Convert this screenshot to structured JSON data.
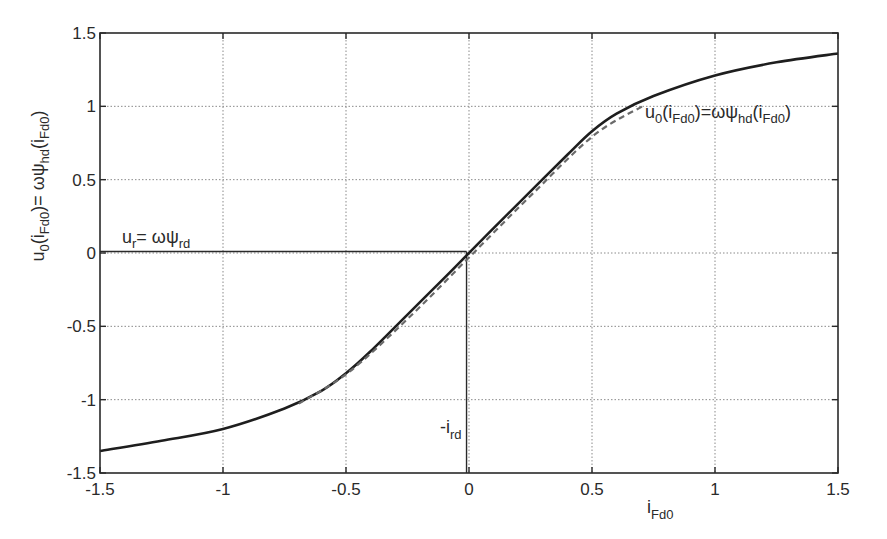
{
  "chart_data": {
    "type": "line",
    "title": "",
    "xlabel": "i_Fd0",
    "ylabel": "u0(iFd0)= ωψhd(iFd0)",
    "xlim": [
      -1.5,
      1.5
    ],
    "ylim": [
      -1.5,
      1.5
    ],
    "grid": true,
    "x_ticks": [
      -1.5,
      -1,
      -0.5,
      0,
      0.5,
      1,
      1.5
    ],
    "x_tick_labels": [
      "-1.5",
      "-1",
      "-0.5",
      "0",
      "0.5",
      "1",
      "1.5"
    ],
    "y_ticks": [
      -1.5,
      -1,
      -0.5,
      0,
      0.5,
      1,
      1.5
    ],
    "y_tick_labels": [
      "-1.5",
      "-1",
      "-0.5",
      "0",
      "0.5",
      "1",
      "1.5"
    ],
    "series": [
      {
        "name": "u0(iFd0)=ωψhd(iFd0)",
        "style": "solid",
        "x": [
          -1.5,
          -1.25,
          -1.0,
          -0.75,
          -0.6,
          -0.5,
          -0.4,
          -0.25,
          -0.1,
          0.0,
          0.1,
          0.25,
          0.4,
          0.5,
          0.6,
          0.75,
          1.0,
          1.25,
          1.5
        ],
        "values": [
          -1.35,
          -1.28,
          -1.2,
          -1.06,
          -0.94,
          -0.82,
          -0.67,
          -0.42,
          -0.17,
          0.0,
          0.17,
          0.42,
          0.67,
          0.83,
          0.95,
          1.07,
          1.21,
          1.3,
          1.36
        ]
      },
      {
        "name": "linearized approximation",
        "style": "dashed",
        "x": [
          -0.7,
          -0.5,
          -0.25,
          0.0,
          0.25,
          0.5,
          0.7
        ],
        "values": [
          -1.02,
          -0.81,
          -0.43,
          -0.01,
          0.41,
          0.81,
          1.01
        ]
      }
    ],
    "annotations": [
      {
        "text": "u_r = ωψ_rd",
        "x": -1.35,
        "y": 0.03,
        "main": "u",
        "sub1": "r",
        "mid": "= ωψ",
        "sub2": "rd"
      },
      {
        "text": "-i_rd",
        "x": -0.07,
        "y": -1.23,
        "main": "-i",
        "sub": "rd"
      },
      {
        "text": "u0(iFd0)=ωψhd(iFd0)",
        "x": 0.63,
        "y": 0.93
      }
    ],
    "reference_lines": [
      {
        "type": "horizontal",
        "y": 0.01,
        "x_from": -1.5,
        "x_to": -0.01,
        "label": "u_r"
      },
      {
        "type": "vertical",
        "x": -0.01,
        "y_from": -1.5,
        "y_to": 0.01,
        "label": "-i_rd"
      }
    ]
  },
  "labels": {
    "ylabel_parts": {
      "u": "u",
      "sub0": "0",
      "open1": "(i",
      "subFd0a": "Fd0",
      "eq": ")= ωψ",
      "subhd": "hd",
      "open2": "(i",
      "subFd0b": "Fd0",
      "close": ")"
    },
    "xlabel_parts": {
      "i": "i",
      "sub": "Fd0"
    },
    "curve_label_parts": {
      "u": "u",
      "sub0": "0",
      "open1": "(i",
      "subFd0a": "Fd0",
      "eq": ")=ωψ",
      "subhd": "hd",
      "open2": "(i",
      "subFd0b": "Fd0",
      "close": ")"
    },
    "ur_label_parts": {
      "u": "u",
      "sub": "r",
      "eq": "= ωψ",
      "sub2": "rd"
    },
    "ird_label_parts": {
      "i": "-i",
      "sub": "rd"
    }
  },
  "colors": {
    "axis": "#2a2a2a",
    "grid": "#8a8a8a",
    "curve": "#1e1e1e",
    "dashed": "#6a6a6a",
    "background": "#ffffff"
  }
}
